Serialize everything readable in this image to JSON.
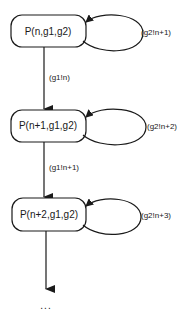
{
  "diagram": {
    "type": "state-transition",
    "nodes": [
      {
        "id": "s0",
        "label": "P(n,g1,g2)"
      },
      {
        "id": "s1",
        "label": "P(n+1,g1,g2)"
      },
      {
        "id": "s2",
        "label": "P(n+2,g1,g2)"
      }
    ],
    "self_loops": [
      {
        "node": "s0",
        "label": "(g2!n+1)"
      },
      {
        "node": "s1",
        "label": "(g2!n+2)"
      },
      {
        "node": "s2",
        "label": "(g2!n+3)"
      }
    ],
    "transitions": [
      {
        "from": "s0",
        "to": "s1",
        "label": "(g1!n)"
      },
      {
        "from": "s1",
        "to": "s2",
        "label": "(g1!n+1)"
      },
      {
        "from": "s2",
        "to": "continuation",
        "label": ""
      }
    ],
    "continuation": "..."
  }
}
